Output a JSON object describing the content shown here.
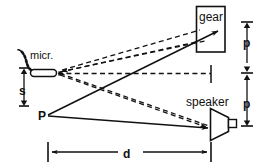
{
  "figure": {
    "background_color": "#ffffff",
    "line_color": "#111111",
    "labels": {
      "gear": "gear",
      "speaker": "speaker",
      "microphone": "micr.",
      "source_point": "P",
      "mic_offset": "s",
      "pitch_upper": "p",
      "pitch_lower": "p",
      "distance": "d"
    },
    "components": [
      {
        "name": "gear",
        "label": "gear",
        "shape": "rectangle"
      },
      {
        "name": "speaker",
        "label": "speaker",
        "shape": "cone-with-magnet"
      },
      {
        "name": "microphone",
        "label": "micr.",
        "shape": "capsule-with-cable"
      },
      {
        "name": "source-point",
        "label": "P",
        "shape": "point"
      }
    ],
    "dimensions": [
      {
        "name": "mic-offset",
        "label": "s",
        "orientation": "vertical",
        "position": "left"
      },
      {
        "name": "pitch-upper",
        "label": "p",
        "orientation": "vertical",
        "position": "right"
      },
      {
        "name": "pitch-lower",
        "label": "p",
        "orientation": "vertical",
        "position": "right"
      },
      {
        "name": "separation-distance",
        "label": "d",
        "orientation": "horizontal",
        "position": "bottom"
      }
    ],
    "rays": [
      {
        "name": "p-to-gear",
        "style": "solid",
        "arrow": true
      },
      {
        "name": "p-to-speaker",
        "style": "solid",
        "arrow": true
      },
      {
        "name": "mic-to-gear",
        "style": "dashed",
        "arrow": false
      },
      {
        "name": "mic-to-speaker",
        "style": "dashed",
        "arrow": false
      },
      {
        "name": "gear-to-mic",
        "style": "dashed",
        "arrow": true
      },
      {
        "name": "speaker-to-mic",
        "style": "dashed",
        "arrow": true
      },
      {
        "name": "mic-axis-reference",
        "style": "dashed",
        "arrow": false
      }
    ]
  }
}
